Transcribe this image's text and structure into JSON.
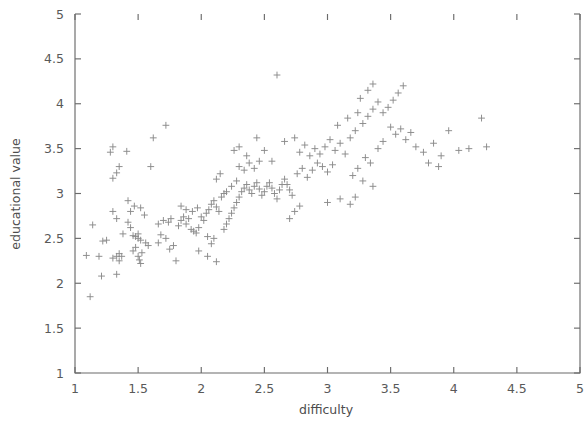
{
  "chart_data": {
    "type": "scatter",
    "title": "",
    "xlabel": "difficulty",
    "ylabel": "educational value",
    "xlim": [
      1,
      5
    ],
    "ylim": [
      1,
      5
    ],
    "xticks": [
      "1",
      "1.5",
      "2",
      "2.5",
      "3",
      "3.5",
      "4",
      "4.5",
      "5"
    ],
    "yticks": [
      "1",
      "1.5",
      "2",
      "2.5",
      "3",
      "3.5",
      "4",
      "4.5",
      "5"
    ],
    "xtick_values": [
      1,
      1.5,
      2,
      2.5,
      3,
      3.5,
      4,
      4.5,
      5
    ],
    "ytick_values": [
      1,
      1.5,
      2,
      2.5,
      3,
      3.5,
      4,
      4.5,
      5
    ],
    "grid": false,
    "legend": null,
    "marker": "plus",
    "marker_color": "#8a8a8a",
    "n_points": 193,
    "points": [
      [
        1.12,
        1.85
      ],
      [
        1.09,
        2.31
      ],
      [
        1.19,
        2.3
      ],
      [
        1.14,
        2.65
      ],
      [
        1.22,
        2.47
      ],
      [
        1.25,
        2.48
      ],
      [
        1.3,
        2.8
      ],
      [
        1.33,
        2.72
      ],
      [
        1.21,
        2.08
      ],
      [
        1.33,
        2.1
      ],
      [
        1.3,
        2.28
      ],
      [
        1.33,
        2.3
      ],
      [
        1.35,
        2.25
      ],
      [
        1.35,
        2.33
      ],
      [
        1.37,
        2.3
      ],
      [
        1.38,
        2.55
      ],
      [
        1.42,
        2.68
      ],
      [
        1.44,
        2.62
      ],
      [
        1.46,
        2.53
      ],
      [
        1.48,
        2.52
      ],
      [
        1.5,
        2.5
      ],
      [
        1.5,
        2.55
      ],
      [
        1.52,
        2.48
      ],
      [
        1.46,
        2.36
      ],
      [
        1.5,
        2.3
      ],
      [
        1.51,
        2.26
      ],
      [
        1.52,
        2.22
      ],
      [
        1.53,
        2.34
      ],
      [
        1.48,
        2.4
      ],
      [
        1.56,
        2.45
      ],
      [
        1.58,
        2.42
      ],
      [
        1.44,
        2.8
      ],
      [
        1.47,
        2.86
      ],
      [
        1.52,
        2.84
      ],
      [
        1.55,
        2.76
      ],
      [
        1.42,
        2.92
      ],
      [
        1.3,
        3.17
      ],
      [
        1.33,
        3.23
      ],
      [
        1.35,
        3.3
      ],
      [
        1.28,
        3.46
      ],
      [
        1.41,
        3.47
      ],
      [
        1.3,
        3.52
      ],
      [
        1.62,
        3.62
      ],
      [
        1.72,
        3.76
      ],
      [
        1.6,
        3.3
      ],
      [
        1.68,
        2.54
      ],
      [
        1.66,
        2.45
      ],
      [
        1.72,
        2.5
      ],
      [
        1.75,
        2.38
      ],
      [
        1.78,
        2.42
      ],
      [
        1.8,
        2.25
      ],
      [
        1.66,
        2.66
      ],
      [
        1.7,
        2.7
      ],
      [
        1.74,
        2.68
      ],
      [
        1.76,
        2.72
      ],
      [
        1.82,
        2.64
      ],
      [
        1.84,
        2.7
      ],
      [
        1.86,
        2.74
      ],
      [
        1.88,
        2.66
      ],
      [
        1.9,
        2.72
      ],
      [
        1.92,
        2.6
      ],
      [
        1.94,
        2.58
      ],
      [
        1.96,
        2.56
      ],
      [
        1.98,
        2.62
      ],
      [
        1.84,
        2.86
      ],
      [
        1.88,
        2.82
      ],
      [
        1.93,
        2.8
      ],
      [
        1.97,
        2.84
      ],
      [
        2.0,
        2.74
      ],
      [
        2.02,
        2.7
      ],
      [
        2.04,
        2.78
      ],
      [
        2.06,
        2.82
      ],
      [
        2.08,
        2.88
      ],
      [
        2.1,
        2.92
      ],
      [
        2.12,
        2.85
      ],
      [
        2.14,
        2.8
      ],
      [
        2.05,
        2.52
      ],
      [
        2.1,
        2.5
      ],
      [
        2.18,
        2.6
      ],
      [
        2.2,
        2.66
      ],
      [
        2.22,
        2.72
      ],
      [
        2.24,
        2.78
      ],
      [
        2.26,
        2.84
      ],
      [
        2.28,
        2.9
      ],
      [
        2.3,
        2.96
      ],
      [
        2.32,
        3.02
      ],
      [
        2.34,
        3.06
      ],
      [
        2.36,
        3.1
      ],
      [
        2.38,
        3.04
      ],
      [
        2.4,
        3.0
      ],
      [
        2.42,
        3.08
      ],
      [
        2.44,
        3.12
      ],
      [
        2.46,
        3.05
      ],
      [
        2.48,
        2.98
      ],
      [
        2.5,
        3.02
      ],
      [
        2.52,
        3.08
      ],
      [
        2.54,
        3.12
      ],
      [
        2.56,
        3.06
      ],
      [
        2.58,
        3.0
      ],
      [
        2.6,
        2.94
      ],
      [
        2.62,
        3.04
      ],
      [
        2.64,
        3.1
      ],
      [
        2.66,
        3.16
      ],
      [
        2.68,
        3.1
      ],
      [
        2.7,
        3.04
      ],
      [
        2.72,
        2.98
      ],
      [
        2.2,
        3.02
      ],
      [
        2.24,
        3.08
      ],
      [
        2.28,
        3.14
      ],
      [
        2.16,
        2.96
      ],
      [
        2.18,
        3.0
      ],
      [
        2.12,
        3.16
      ],
      [
        2.15,
        3.22
      ],
      [
        2.3,
        3.3
      ],
      [
        2.34,
        3.26
      ],
      [
        2.38,
        3.34
      ],
      [
        2.42,
        3.28
      ],
      [
        2.46,
        3.36
      ],
      [
        2.36,
        3.42
      ],
      [
        2.26,
        3.48
      ],
      [
        2.05,
        2.3
      ],
      [
        2.12,
        2.24
      ],
      [
        1.98,
        2.36
      ],
      [
        2.08,
        2.44
      ],
      [
        2.76,
        3.22
      ],
      [
        2.8,
        3.28
      ],
      [
        2.84,
        3.18
      ],
      [
        2.88,
        3.26
      ],
      [
        2.92,
        3.34
      ],
      [
        2.96,
        3.3
      ],
      [
        3.0,
        3.24
      ],
      [
        3.04,
        3.32
      ],
      [
        2.78,
        3.46
      ],
      [
        2.82,
        3.54
      ],
      [
        2.86,
        3.42
      ],
      [
        2.9,
        3.5
      ],
      [
        2.94,
        3.44
      ],
      [
        2.98,
        3.52
      ],
      [
        3.02,
        3.6
      ],
      [
        3.06,
        3.48
      ],
      [
        3.1,
        3.56
      ],
      [
        3.14,
        3.44
      ],
      [
        3.18,
        3.62
      ],
      [
        3.22,
        3.7
      ],
      [
        3.08,
        3.76
      ],
      [
        3.16,
        3.84
      ],
      [
        3.24,
        3.9
      ],
      [
        3.28,
        3.78
      ],
      [
        3.32,
        3.86
      ],
      [
        3.36,
        3.94
      ],
      [
        3.26,
        4.06
      ],
      [
        3.32,
        4.15
      ],
      [
        3.4,
        4.02
      ],
      [
        3.44,
        3.9
      ],
      [
        3.48,
        3.96
      ],
      [
        3.52,
        4.04
      ],
      [
        3.56,
        4.12
      ],
      [
        3.6,
        4.2
      ],
      [
        3.36,
        4.22
      ],
      [
        3.5,
        3.74
      ],
      [
        3.54,
        3.66
      ],
      [
        3.58,
        3.72
      ],
      [
        3.62,
        3.6
      ],
      [
        3.66,
        3.68
      ],
      [
        3.44,
        3.58
      ],
      [
        3.4,
        3.5
      ],
      [
        3.3,
        3.4
      ],
      [
        3.34,
        3.34
      ],
      [
        3.24,
        3.28
      ],
      [
        3.2,
        3.2
      ],
      [
        3.28,
        3.14
      ],
      [
        3.36,
        3.08
      ],
      [
        3.1,
        2.94
      ],
      [
        3.18,
        2.88
      ],
      [
        3.0,
        2.9
      ],
      [
        3.22,
        2.96
      ],
      [
        2.6,
        4.32
      ],
      [
        2.74,
        3.62
      ],
      [
        2.66,
        3.58
      ],
      [
        2.56,
        3.36
      ],
      [
        2.5,
        3.48
      ],
      [
        2.44,
        3.62
      ],
      [
        2.3,
        3.52
      ],
      [
        2.7,
        2.72
      ],
      [
        2.74,
        2.8
      ],
      [
        2.78,
        2.86
      ],
      [
        3.7,
        3.52
      ],
      [
        3.76,
        3.46
      ],
      [
        3.84,
        3.56
      ],
      [
        3.9,
        3.42
      ],
      [
        3.96,
        3.7
      ],
      [
        4.04,
        3.48
      ],
      [
        4.12,
        3.5
      ],
      [
        4.22,
        3.84
      ],
      [
        4.26,
        3.52
      ],
      [
        3.8,
        3.34
      ],
      [
        3.88,
        3.3
      ]
    ]
  },
  "axes": {
    "x_title": "difficulty",
    "y_title": "educational value"
  }
}
